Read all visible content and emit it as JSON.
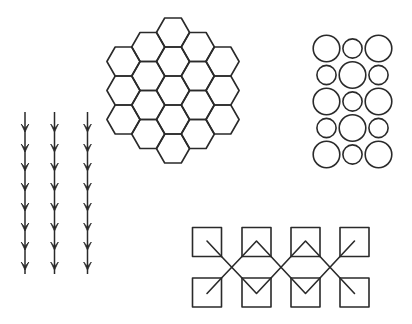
{
  "canvas": {
    "width": 412,
    "height": 324,
    "background": "#ffffff",
    "stroke_color": "#2a2a2a"
  },
  "figures": {
    "hexagon_grid": {
      "orientation": "flat-top",
      "side": 16.6,
      "hex_height": 29,
      "columns": [
        {
          "cx": 123.5,
          "top": 47,
          "count": 3
        },
        {
          "cx": 148.3,
          "top": 32.5,
          "count": 4
        },
        {
          "cx": 173.0,
          "top": 18,
          "count": 5
        },
        {
          "cx": 197.8,
          "top": 32.5,
          "count": 4
        },
        {
          "cx": 222.5,
          "top": 47,
          "count": 3
        }
      ]
    },
    "circle_grid": {
      "columns_x": [
        326.5,
        352.5,
        378.5
      ],
      "rows_y": [
        48.5,
        75,
        101.5,
        128,
        154.5
      ],
      "large_radius": 13.3,
      "small_radius": 9.6,
      "pattern": [
        [
          "large",
          "small",
          "large"
        ],
        [
          "small",
          "large",
          "small"
        ],
        [
          "large",
          "small",
          "large"
        ],
        [
          "small",
          "large",
          "small"
        ],
        [
          "large",
          "small",
          "large"
        ]
      ]
    },
    "arrow_columns": {
      "xs": [
        25,
        54.5,
        87.5
      ],
      "line_top": 112,
      "line_bottom": 274,
      "head_tips_y": [
        132,
        152,
        171,
        191,
        211,
        231,
        250,
        270
      ],
      "head_half_width": 3.8,
      "head_length": 8,
      "direction": "down"
    },
    "square_chain": {
      "square_size": 29,
      "columns_x": [
        192.5,
        242,
        291,
        340
      ],
      "top_row_y": 227.5,
      "bottom_row_y": 278,
      "crossings": [
        {
          "x": 232,
          "y": 268
        },
        {
          "x": 281,
          "y": 268
        },
        {
          "x": 330,
          "y": 268
        }
      ],
      "inner_marks": [
        "diagonal-in",
        "chevron",
        "chevron",
        "diagonal-out"
      ]
    }
  }
}
